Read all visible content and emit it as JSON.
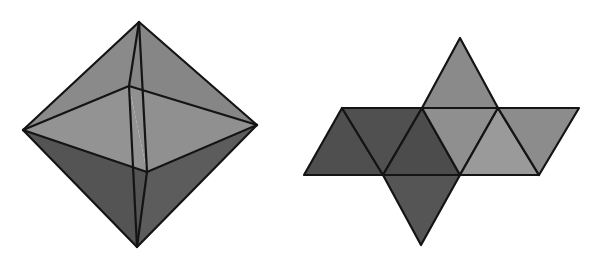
{
  "figure": {
    "colors": {
      "background": "#ffffff",
      "stroke": "#141414",
      "light": "#8e8e8e",
      "mid": "#7a7a7a",
      "dark": "#545454",
      "darker": "#4a4a4a"
    },
    "octahedron": {
      "label": "octahedron-solid",
      "vertices": {
        "top": [
          139,
          22
        ],
        "left": [
          23,
          130
        ],
        "right": [
          257,
          125
        ],
        "bottom": [
          137,
          247
        ],
        "back": [
          129,
          86
        ],
        "front": [
          147,
          172
        ]
      },
      "faces": [
        {
          "name": "upper-left-face",
          "points": "139,22 23,130 129,86",
          "fill": "#8a8a8a"
        },
        {
          "name": "upper-right-face",
          "points": "139,22 129,86 257,125",
          "fill": "#868686"
        },
        {
          "name": "upper-front-left-face",
          "points": "23,130 129,86 147,172",
          "fill": "#939393"
        },
        {
          "name": "upper-front-right-face",
          "points": "129,86 257,125 147,172",
          "fill": "#909090"
        },
        {
          "name": "lower-left-face",
          "points": "23,130 147,172 137,247",
          "fill": "#545454"
        },
        {
          "name": "lower-right-face",
          "points": "147,172 257,125 137,247",
          "fill": "#5c5c5c"
        }
      ],
      "edges": [
        "139,22 23,130",
        "139,22 257,125",
        "23,130 137,247",
        "257,125 137,247",
        "23,130 129,86",
        "129,86 257,125",
        "23,130 147,172",
        "147,172 257,125",
        "139,22 129,86",
        "129,86 137,247",
        "139,22 147,172",
        "147,172 137,247"
      ]
    },
    "net": {
      "label": "octahedron-net",
      "faces": [
        {
          "name": "net-top-triangle",
          "points": "422,108 498,108 460,38",
          "fill": "#8a8a8a"
        },
        {
          "name": "net-row-left-1",
          "points": "342,108 304,175 383,175",
          "fill": "#4f4f4f"
        },
        {
          "name": "net-row-left-2",
          "points": "342,108 422,108 383,175",
          "fill": "#505050"
        },
        {
          "name": "net-row-center-1",
          "points": "422,108 383,175 460,175",
          "fill": "#4c4c4c"
        },
        {
          "name": "net-row-center-2",
          "points": "422,108 498,108 460,175",
          "fill": "#8f8f8f"
        },
        {
          "name": "net-row-right-1",
          "points": "498,108 460,175 539,175",
          "fill": "#9a9a9a"
        },
        {
          "name": "net-row-right-2",
          "points": "498,108 579,108 539,175",
          "fill": "#8c8c8c"
        },
        {
          "name": "net-bottom-triangle",
          "points": "383,175 460,175 421,245",
          "fill": "#555555"
        }
      ]
    }
  }
}
